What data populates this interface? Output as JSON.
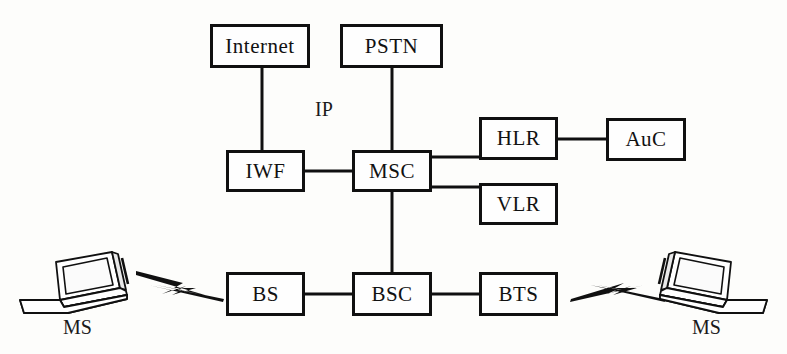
{
  "diagram": {
    "background_color": "#fdfdfb",
    "line_color": "#101010",
    "boxes": [
      {
        "id": "internet",
        "label": "Internet",
        "x": 210,
        "y": 24,
        "w": 100,
        "h": 44
      },
      {
        "id": "pstn",
        "label": "PSTN",
        "x": 340,
        "y": 24,
        "w": 103,
        "h": 44
      },
      {
        "id": "iwf",
        "label": "IWF",
        "x": 226,
        "y": 150,
        "w": 79,
        "h": 42
      },
      {
        "id": "msc",
        "label": "MSC",
        "x": 352,
        "y": 150,
        "w": 80,
        "h": 42
      },
      {
        "id": "hlr",
        "label": "HLR",
        "x": 479,
        "y": 117,
        "w": 79,
        "h": 43
      },
      {
        "id": "auc",
        "label": "AuC",
        "x": 606,
        "y": 118,
        "w": 80,
        "h": 43
      },
      {
        "id": "vlr",
        "label": "VLR",
        "x": 479,
        "y": 183,
        "w": 79,
        "h": 42
      },
      {
        "id": "bs",
        "label": "BS",
        "x": 226,
        "y": 272,
        "w": 79,
        "h": 44
      },
      {
        "id": "bsc",
        "label": "BSC",
        "x": 352,
        "y": 272,
        "w": 80,
        "h": 44
      },
      {
        "id": "bts",
        "label": "BTS",
        "x": 479,
        "y": 272,
        "w": 79,
        "h": 44
      }
    ],
    "labels": [
      {
        "id": "ip-label",
        "text": "IP",
        "x": 315,
        "y": 99
      },
      {
        "id": "ms-left-label",
        "text": "MS",
        "x": 63,
        "y": 317
      },
      {
        "id": "ms-right-label",
        "text": "MS",
        "x": 692,
        "y": 317
      }
    ],
    "devices": [
      {
        "id": "ms-left",
        "label": "MS",
        "type": "laptop",
        "x": 20,
        "y": 250,
        "w": 115,
        "h": 62,
        "mirrored": false
      },
      {
        "id": "ms-right",
        "label": "MS",
        "type": "laptop",
        "x": 645,
        "y": 250,
        "w": 115,
        "h": 62,
        "mirrored": true
      }
    ],
    "links": [
      {
        "id": "internet-iwf",
        "from": "internet",
        "to": "iwf",
        "kind": "wired"
      },
      {
        "id": "pstn-msc",
        "from": "pstn",
        "to": "msc",
        "kind": "wired"
      },
      {
        "id": "iwf-msc",
        "from": "iwf",
        "to": "msc",
        "kind": "wired"
      },
      {
        "id": "msc-hlr",
        "from": "msc",
        "to": "hlr",
        "kind": "wired"
      },
      {
        "id": "msc-vlr",
        "from": "msc",
        "to": "vlr",
        "kind": "wired"
      },
      {
        "id": "hlr-auc",
        "from": "hlr",
        "to": "auc",
        "kind": "wired"
      },
      {
        "id": "msc-bsc",
        "from": "msc",
        "to": "bsc",
        "kind": "wired"
      },
      {
        "id": "bs-bsc",
        "from": "bs",
        "to": "bsc",
        "kind": "wired"
      },
      {
        "id": "bsc-bts",
        "from": "bsc",
        "to": "bts",
        "kind": "wired"
      },
      {
        "id": "ms-left-bs",
        "from": "ms-left",
        "to": "bs",
        "kind": "wireless"
      },
      {
        "id": "bts-ms-right",
        "from": "bts",
        "to": "ms-right",
        "kind": "wireless"
      }
    ]
  }
}
